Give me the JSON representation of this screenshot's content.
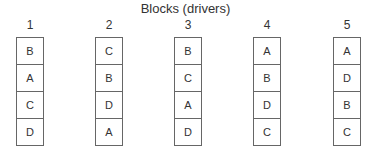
{
  "title": "Blocks (drivers)",
  "blocks": [
    {
      "label": "1",
      "cells": [
        "B",
        "A",
        "C",
        "D"
      ]
    },
    {
      "label": "2",
      "cells": [
        "C",
        "B",
        "D",
        "A"
      ]
    },
    {
      "label": "3",
      "cells": [
        "B",
        "C",
        "A",
        "D"
      ]
    },
    {
      "label": "4",
      "cells": [
        "A",
        "B",
        "D",
        "C"
      ]
    },
    {
      "label": "5",
      "cells": [
        "A",
        "D",
        "B",
        "C"
      ]
    }
  ]
}
